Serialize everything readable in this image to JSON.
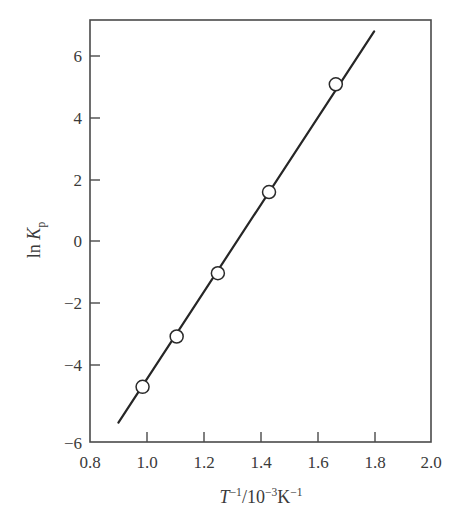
{
  "chart_data": {
    "type": "line",
    "title": "",
    "subtitle": "",
    "xlabel_parts": {
      "var": "T",
      "var_sup": "−1",
      "separator": "/10",
      "exp": "−3",
      "unit": "K",
      "unit_sup": "−1",
      "full": "T⁻¹/10⁻³K⁻¹"
    },
    "ylabel_parts": {
      "prefix": "ln ",
      "var": "K",
      "subscript": "p",
      "full": "ln Kₚ"
    },
    "xlim": [
      0.8,
      2.0
    ],
    "ylim": [
      -6,
      7
    ],
    "xticks": [
      0.8,
      1.0,
      1.2,
      1.4,
      1.6,
      1.8,
      2.0
    ],
    "xtick_labels": [
      "0.8",
      "1.0",
      "1.2",
      "1.4",
      "1.6",
      "1.8",
      "2.0"
    ],
    "yticks": [
      -6,
      -4,
      -2,
      0,
      2,
      4,
      6
    ],
    "ytick_labels": [
      "−6",
      "−4",
      "−2",
      "0",
      "2",
      "4",
      "6"
    ],
    "grid": false,
    "legend": null,
    "series": [
      {
        "name": "ln Kp vs inverse temperature",
        "marker": "open-circle",
        "line_color": "#262626",
        "marker_fill": "#ffffff",
        "points": [
          {
            "x": 0.985,
            "y": -4.3
          },
          {
            "x": 1.105,
            "y": -2.75
          },
          {
            "x": 1.25,
            "y": -0.8
          },
          {
            "x": 1.43,
            "y": 1.7
          },
          {
            "x": 1.665,
            "y": 5.02
          }
        ],
        "fit_line": {
          "x_start": 0.9,
          "y_start": -5.4,
          "x_end": 1.8,
          "y_end": 6.65
        }
      }
    ]
  },
  "figure": {
    "background": "#ffffff",
    "axis_color": "#4a4a4a",
    "text_color": "#3a3a3a"
  }
}
